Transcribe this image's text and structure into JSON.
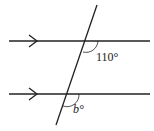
{
  "diagram": {
    "type": "parallel-lines-transversal",
    "lines": [
      {
        "name": "upper-parallel-line",
        "y": 41,
        "x1": 9,
        "x2": 150
      },
      {
        "name": "lower-parallel-line",
        "y": 94,
        "x1": 9,
        "x2": 150
      }
    ],
    "transversal": {
      "x1": 97,
      "y1": 5,
      "x2": 56,
      "y2": 125
    },
    "angles": [
      {
        "name": "angle-110",
        "label": "110°"
      },
      {
        "name": "angle-b",
        "label": "b°"
      }
    ],
    "stroke_color": "#222222"
  }
}
